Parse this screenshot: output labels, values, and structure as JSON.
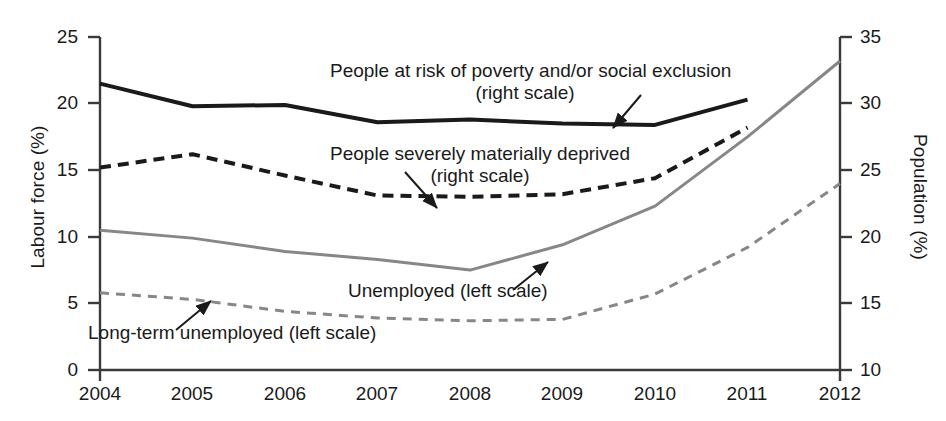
{
  "chart_data": {
    "type": "line",
    "title": "",
    "xlabel": "",
    "ylabel": "Labour force (%)",
    "y2label": "Population (%)",
    "x": [
      2004,
      2005,
      2006,
      2007,
      2008,
      2009,
      2010,
      2011,
      2012
    ],
    "xticklabels": [
      "2004",
      "2005",
      "2006",
      "2007",
      "2008",
      "2009",
      "2010",
      "2011",
      "2012"
    ],
    "ylim": [
      0,
      25
    ],
    "yticks": [
      0,
      5,
      10,
      15,
      20,
      25
    ],
    "yticklabels": [
      "0",
      "5",
      "10",
      "15",
      "20",
      "25"
    ],
    "y2lim": [
      10,
      35
    ],
    "y2ticks": [
      10,
      15,
      20,
      25,
      30,
      35
    ],
    "y2ticklabels": [
      "10",
      "15",
      "20",
      "25",
      "30",
      "35"
    ],
    "grid": false,
    "legend": "annotations-inline",
    "series": [
      {
        "name": "People at risk of poverty and/or social exclusion",
        "axis": "right",
        "style": "solid",
        "color": "#1a1a1a",
        "width": 4,
        "x": [
          2004,
          2005,
          2006,
          2007,
          2008,
          2009,
          2010,
          2011
        ],
        "values": [
          31.5,
          29.8,
          29.9,
          28.6,
          28.8,
          28.5,
          28.4,
          30.3
        ]
      },
      {
        "name": "People severely materially deprived",
        "axis": "right",
        "style": "dashed",
        "color": "#1a1a1a",
        "width": 4,
        "x": [
          2004,
          2005,
          2006,
          2007,
          2008,
          2009,
          2010,
          2011
        ],
        "values": [
          25.2,
          26.2,
          24.6,
          23.1,
          23.0,
          23.2,
          24.4,
          28.2
        ]
      },
      {
        "name": "Unemployed",
        "axis": "left",
        "style": "solid",
        "color": "#878787",
        "width": 3,
        "x": [
          2004,
          2005,
          2006,
          2007,
          2008,
          2009,
          2010,
          2011,
          2012
        ],
        "values": [
          10.5,
          9.9,
          8.9,
          8.3,
          7.5,
          9.4,
          12.3,
          17.5,
          23.2
        ]
      },
      {
        "name": "Long-term unemployed",
        "axis": "left",
        "style": "dashed",
        "color": "#878787",
        "width": 3,
        "x": [
          2004,
          2005,
          2006,
          2007,
          2008,
          2009,
          2010,
          2011,
          2012
        ],
        "values": [
          5.8,
          5.3,
          4.4,
          3.9,
          3.7,
          3.8,
          5.7,
          9.2,
          14.0
        ]
      }
    ],
    "annotations": [
      {
        "id": "poverty",
        "line1": "People at risk of poverty and/or social exclusion",
        "line2": "(right scale)"
      },
      {
        "id": "deprived",
        "line1": "People severely materially deprived",
        "line2": "(right scale)"
      },
      {
        "id": "unemployed",
        "line1": "Unemployed (left scale)",
        "line2": ""
      },
      {
        "id": "long-term-unemployed",
        "line1": "Long-term unemployed (left scale)",
        "line2": ""
      }
    ]
  }
}
